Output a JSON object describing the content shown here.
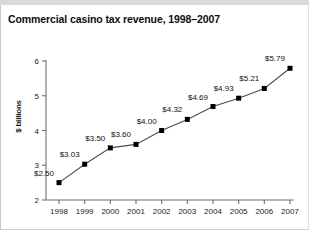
{
  "chart_data": {
    "type": "line",
    "title": "Commercial casino tax revenue, 1998–2007",
    "xlabel": "",
    "ylabel": "$ billions",
    "categories": [
      "1998",
      "1999",
      "2000",
      "2001",
      "2002",
      "2003",
      "2004",
      "2005",
      "2006",
      "2007"
    ],
    "values": [
      2.5,
      3.03,
      3.5,
      3.6,
      4.0,
      4.32,
      4.69,
      4.93,
      5.21,
      5.79
    ],
    "point_labels": [
      "$2.50",
      "$3.03",
      "$3.50",
      "$3.60",
      "$4.00",
      "$4.32",
      "$4.69",
      "$4.93",
      "$5.21",
      "$5.79"
    ],
    "ylim": [
      2,
      6
    ],
    "yticks": [
      2,
      3,
      4,
      5,
      6
    ],
    "ytick_labels": [
      "2",
      "3",
      "4",
      "5",
      "6"
    ],
    "xtick_labels": [
      "1998",
      "1999",
      "2000",
      "2001",
      "2002",
      "2003",
      "2004",
      "2005",
      "2006",
      "2007"
    ],
    "grid": false,
    "legend": null,
    "marker": "square",
    "series_color": "#000000",
    "line_color": "#4d4d4d",
    "background_color": "#ffffff"
  }
}
